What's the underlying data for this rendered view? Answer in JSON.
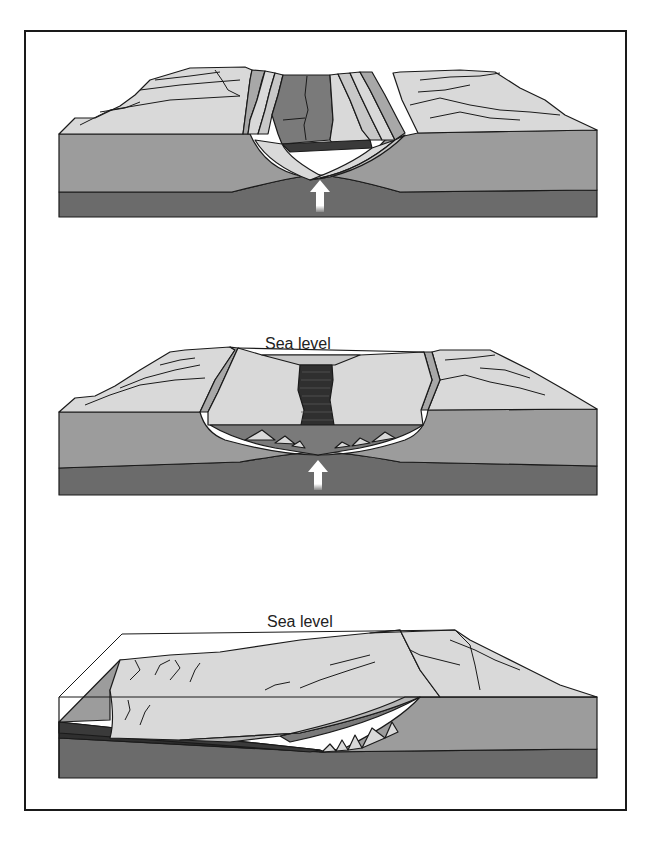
{
  "figure": {
    "panels": [
      {
        "id": "panel-1",
        "stage": "continental rifting",
        "labels": [],
        "arrow": "upwelling-arrow"
      },
      {
        "id": "panel-2",
        "stage": "narrow ocean basin",
        "labels": [
          "Sea level"
        ],
        "arrow": "upwelling-arrow"
      },
      {
        "id": "panel-3",
        "stage": "passive continental margin",
        "labels": [
          "Sea level"
        ]
      }
    ],
    "panel2": {
      "sea_level_label": "Sea level"
    },
    "panel3": {
      "sea_level_label": "Sea level"
    }
  },
  "colors": {
    "land_surface": "#d9d9d9",
    "crust": "#9c9c9c",
    "mantle": "#6b6b6b",
    "rift_floor": "#7a7a7a",
    "oceanic_crust": "#3a3a3a",
    "sediment": "#c8c8c8",
    "outline": "#1a1a1a",
    "arrow": "#ffffff"
  }
}
